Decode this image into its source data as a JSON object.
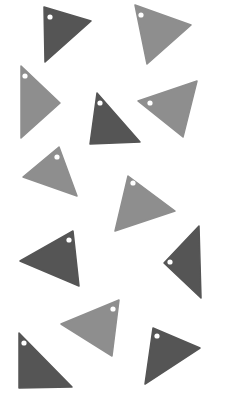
{
  "scene": {
    "width": 231,
    "height": 393,
    "background": "#ffffff",
    "description": "Twelve triangular tags with punched holes scattered on a white background",
    "colors": {
      "dark": "#555555",
      "light": "#8e8e8e",
      "hole": "#ffffff"
    },
    "triangles": [
      {
        "id": 1,
        "tone": "dark",
        "points": "44,7 91,21 45,62",
        "hole": [
          50,
          17
        ]
      },
      {
        "id": 2,
        "tone": "light",
        "points": "135,5 191,25 147,64",
        "hole": [
          141,
          15
        ]
      },
      {
        "id": 3,
        "tone": "light",
        "points": "21,66 60,103 21,138",
        "hole": [
          25,
          76
        ]
      },
      {
        "id": 4,
        "tone": "dark",
        "points": "97,93 140,142 90,144",
        "hole": [
          100,
          103
        ]
      },
      {
        "id": 5,
        "tone": "light",
        "points": "138,101 197,81 183,137",
        "hole": [
          150,
          103
        ]
      },
      {
        "id": 6,
        "tone": "light",
        "points": "23,177 59,147 77,196",
        "hole": [
          57,
          157
        ]
      },
      {
        "id": 7,
        "tone": "light",
        "points": "128,176 175,211 115,231",
        "hole": [
          133,
          183
        ]
      },
      {
        "id": 8,
        "tone": "dark",
        "points": "20,261 73,231 79,286",
        "hole": [
          69,
          240
        ]
      },
      {
        "id": 9,
        "tone": "dark",
        "points": "199,226 164,263 201,298",
        "hole": [
          170,
          262
        ]
      },
      {
        "id": 10,
        "tone": "light",
        "points": "61,324 119,300 112,356",
        "hole": [
          113,
          309
        ]
      },
      {
        "id": 11,
        "tone": "dark",
        "points": "19,333 72,387 19,388",
        "hole": [
          24,
          343
        ]
      },
      {
        "id": 12,
        "tone": "dark",
        "points": "153,328 200,348 145,384",
        "hole": [
          157,
          336
        ]
      }
    ]
  }
}
